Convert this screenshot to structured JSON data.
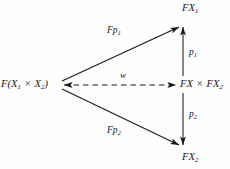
{
  "figure": {
    "type": "commutative-diagram",
    "background_color": "#fdfdfd",
    "line_color": "#16181a",
    "nodes": [
      {
        "id": "source",
        "text_html": "F(X<sub>1</sub> <span class=\"op\">&#215;</span> X<sub>2</sub>)",
        "x": 57,
        "y": 85
      },
      {
        "id": "product",
        "text_html": "FX <span class=\"op\">&#215;</span> FX<sub>2</sub>",
        "x": 180,
        "y": 85
      },
      {
        "id": "fx1",
        "text_html": "FX<sub>1</sub>",
        "x": 182,
        "y": 22
      },
      {
        "id": "fx2",
        "text_html": "FX<sub>2</sub>",
        "x": 182,
        "y": 150
      }
    ],
    "edges": [
      {
        "id": "fp1",
        "label_html": "F<span style=\"letter-spacing:.2px\">p</span><sub>1</sub>",
        "from": "source",
        "to": "fx1",
        "style": "solid",
        "arrow": "end"
      },
      {
        "id": "fp2",
        "label_html": "F<span style=\"letter-spacing:.2px\">p</span><sub>2</sub>",
        "from": "source",
        "to": "fx2",
        "style": "solid",
        "arrow": "end"
      },
      {
        "id": "p1",
        "label_html": "p<sub>1</sub>",
        "from": "product",
        "to": "fx1",
        "style": "solid",
        "arrow": "end"
      },
      {
        "id": "p2",
        "label_html": "p<sub>2</sub>",
        "from": "product",
        "to": "fx2",
        "style": "solid",
        "arrow": "end"
      },
      {
        "id": "w",
        "label_html": "w",
        "from": "source",
        "to": "product",
        "style": "dashed",
        "arrow": "both"
      }
    ]
  }
}
